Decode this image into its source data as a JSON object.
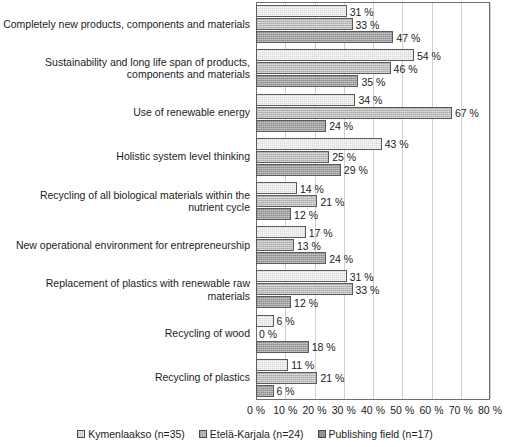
{
  "chart_data": {
    "type": "bar",
    "orientation": "horizontal",
    "title": "",
    "xlabel": "",
    "ylabel": "",
    "xlim": [
      0,
      80
    ],
    "xticks": [
      "0 %",
      "10 %",
      "20 %",
      "30 %",
      "40 %",
      "50 %",
      "60 %",
      "70 %",
      "80 %"
    ],
    "xtick_values": [
      0,
      10,
      20,
      30,
      40,
      50,
      60,
      70,
      80
    ],
    "grid": true,
    "legend_position": "bottom",
    "value_suffix": " %",
    "categories": [
      "Completely new products, components and materials",
      "Sustainability and long life span of products, components and materials",
      "Use of renewable energy",
      "Holistic system level thinking",
      "Recycling of all biological materials within the nutrient cycle",
      "New operational environment for entrepreneurship",
      "Replacement of plastics with renewable raw materials",
      "Recycling of wood",
      "Recycling of plastics"
    ],
    "series": [
      {
        "name": "Kymenlaakso (n=35)",
        "values": [
          31,
          54,
          34,
          43,
          14,
          17,
          31,
          6,
          11
        ],
        "labels": [
          "31 %",
          "54 %",
          "34 %",
          "43 %",
          "14 %",
          "17 %",
          "31 %",
          "6 %",
          "11 %"
        ]
      },
      {
        "name": "Etelä-Karjala (n=24)",
        "values": [
          33,
          46,
          67,
          25,
          21,
          13,
          33,
          0,
          21
        ],
        "labels": [
          "33 %",
          "46 %",
          "67 %",
          "25 %",
          "21 %",
          "13 %",
          "33 %",
          "0 %",
          "21 %"
        ]
      },
      {
        "name": "Publishing field (n=17)",
        "values": [
          47,
          35,
          24,
          29,
          12,
          24,
          12,
          18,
          6
        ],
        "labels": [
          "47 %",
          "35 %",
          "24 %",
          "29 %",
          "12 %",
          "24 %",
          "12 %",
          "18 %",
          "6 %"
        ]
      }
    ],
    "colors": {
      "series_1": "#d8d8d8",
      "series_2": "#bdbdbd",
      "series_3": "#a3a3a3",
      "bar_outline": "#5a5a5a",
      "gridline": "#d0d0d0",
      "axis": "#6e6e6e",
      "text": "#1c1c1c"
    }
  }
}
